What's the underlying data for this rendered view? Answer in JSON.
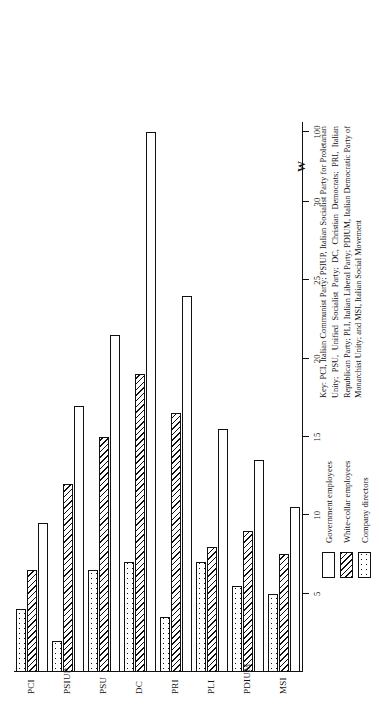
{
  "chart_data": {
    "type": "bar",
    "orientation": "horizontal-rotated",
    "title": "",
    "xlabel": "",
    "ylabel": "",
    "categories": [
      "PCI",
      "PSIUP",
      "PSU",
      "DC",
      "PRI",
      "PLI",
      "PDIUM",
      "MSI"
    ],
    "tick_labels": [
      "5",
      "10",
      "15",
      "20",
      "25",
      "30",
      "100"
    ],
    "tick_values": [
      5,
      10,
      15,
      20,
      25,
      30,
      100
    ],
    "axis_break_symbol": "W",
    "axis_break_note": "axis break between 30 and 100",
    "xlim": [
      0,
      35
    ],
    "grid": false,
    "legend_position": "below-plot-left",
    "series": [
      {
        "name": "Government employees",
        "pattern": "white",
        "values": [
          9.5,
          17.0,
          21.5,
          100.0,
          24.0,
          15.5,
          13.5,
          10.5
        ]
      },
      {
        "name": "White-collar employees",
        "pattern": "diagonal-hatch",
        "values": [
          6.5,
          12.0,
          15.0,
          19.0,
          16.5,
          8.0,
          9.0,
          7.5
        ]
      },
      {
        "name": "Company directors",
        "pattern": "dotted",
        "values": [
          4.0,
          2.0,
          6.5,
          7.0,
          3.5,
          7.0,
          5.5,
          5.0
        ]
      }
    ]
  },
  "legend": {
    "items": [
      {
        "label": "Government employees",
        "pattern": "white"
      },
      {
        "label": "White-collar employees",
        "pattern": "diagonal-hatch"
      },
      {
        "label": "Company directors",
        "pattern": "dotted"
      }
    ]
  },
  "key": {
    "text": "Key: PCI, Italian Communist Party; PSIUP, Italian Socialist Party for Proletarian Unity; PSU, Unified Socialist Party; DC, Christian Democrats; PRI, Italian Republican Party; PLI, Italian Liberal Party; PDIUM, Italian Democratic Party of Monarchist Unity; and MSI, Italian Social Movement"
  }
}
